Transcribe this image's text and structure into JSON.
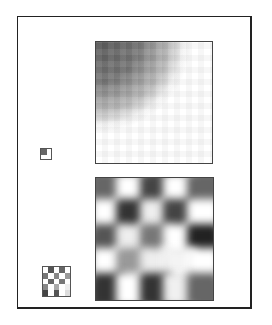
{
  "figure": {
    "frame_color": "#222222",
    "panels": [
      {
        "name": "top-panel",
        "description": "smooth gradient image, dark upper-left fading to white lower-right"
      },
      {
        "name": "bottom-panel",
        "description": "blurred checkerboard-like periodic pattern"
      }
    ],
    "thumbnails": [
      {
        "name": "gradient-thumbnail",
        "fill": "#666666"
      },
      {
        "name": "checker-thumbnail"
      }
    ],
    "checker_cells": [
      "#ffffff",
      "#555555",
      "#ffffff",
      "#666666",
      "#ffffff",
      "#777777",
      "#ffffff",
      "#888888",
      "#ffffff",
      "#999999",
      "#ffffff",
      "#666666",
      "#ffffff",
      "#777777",
      "#ffffff",
      "#888888",
      "#ffffff",
      "#aaaaaa",
      "#ffffff",
      "#eeeeee",
      "#444444",
      "#ffffff",
      "#555555",
      "#ffffff",
      "#dddddd"
    ],
    "bottom_pattern": [
      [
        "#666",
        "#fff",
        "#444",
        "#fff",
        "#666"
      ],
      [
        "#fff",
        "#333",
        "#eee",
        "#444",
        "#fff"
      ],
      [
        "#555",
        "#eee",
        "#777",
        "#fff",
        "#222"
      ],
      [
        "#fff",
        "#999",
        "#eee",
        "#f4f4f4",
        "#fff"
      ],
      [
        "#333",
        "#fff",
        "#333",
        "#f0f0f0",
        "#666"
      ]
    ]
  }
}
